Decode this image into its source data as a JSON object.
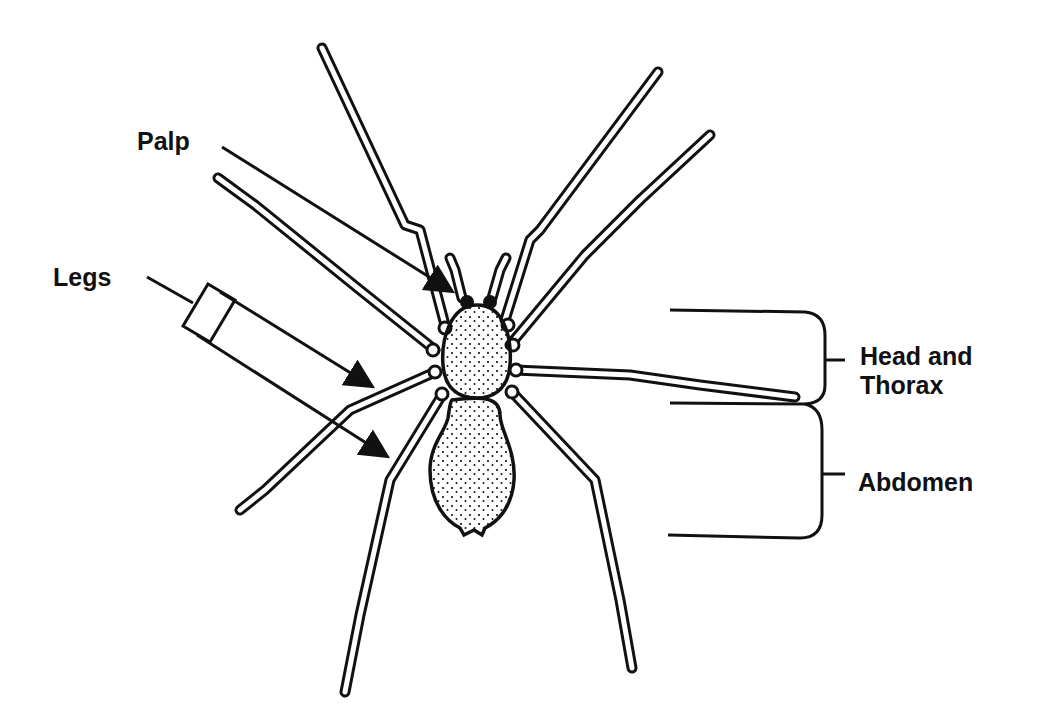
{
  "diagram": {
    "colors": {
      "line": "#111111",
      "background": "#ffffff"
    },
    "labels": {
      "palp": "Palp",
      "legs": "Legs",
      "head_thorax_line1": "Head and",
      "head_thorax_line2": "Thorax",
      "abdomen": "Abdomen"
    }
  }
}
